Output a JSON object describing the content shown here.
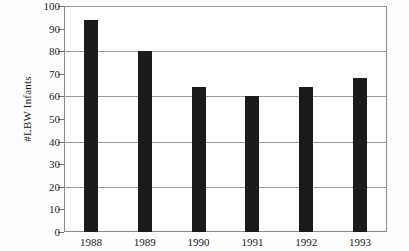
{
  "chart_data": {
    "type": "bar",
    "title": "",
    "xlabel": "",
    "ylabel": "#LBW Infants",
    "categories": [
      "1988",
      "1989",
      "1990",
      "1991",
      "1992",
      "1993"
    ],
    "values": [
      94,
      80,
      64,
      60,
      64,
      68
    ],
    "ylim": [
      0,
      100
    ],
    "yticks": [
      0,
      10,
      20,
      30,
      40,
      50,
      60,
      70,
      80,
      90,
      100
    ],
    "ytick_labels": [
      "0",
      "10",
      "20",
      "30",
      "40",
      "50",
      "60",
      "70",
      "80",
      "90",
      "100"
    ],
    "gridlines": [
      20,
      40,
      60,
      80,
      100
    ],
    "grid": true,
    "legend": false,
    "bar_color": "#1b1b1b",
    "axis_color": "#8a8a8a",
    "grid_color": "#9a9a9a",
    "background_color": "#ffffff"
  }
}
